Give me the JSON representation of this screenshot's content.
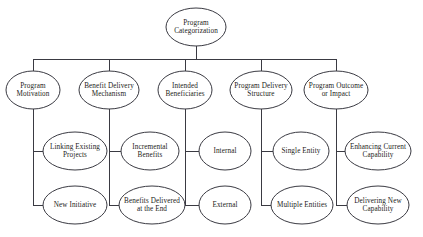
{
  "diagram": {
    "title": "Program Categorization",
    "node_shape": "open-sided-ellipse",
    "line_color": "#3a3a42",
    "text_color": "#1c1c20",
    "background_color": "#ffffff",
    "root": {
      "id": "program-categorization",
      "label": "Program\nCategorization",
      "cx": 196,
      "cy": 27,
      "rx": 30,
      "ry": 19
    },
    "branches": [
      {
        "id": "program-motivation",
        "label": "Program\nMotivation",
        "cx": 33,
        "cy": 90,
        "rx": 27,
        "ry": 19,
        "children": [
          {
            "id": "linking-existing-projects",
            "label": "Linking Existing\nProjects",
            "cx": 75,
            "cy": 151,
            "rx": 32,
            "ry": 19
          },
          {
            "id": "new-initiative",
            "label": "New Initiative",
            "cx": 75,
            "cy": 205,
            "rx": 32,
            "ry": 19
          }
        ]
      },
      {
        "id": "benefit-delivery-mechanism",
        "label": "Benefit Delivery\nMechanism",
        "cx": 109,
        "cy": 90,
        "rx": 30,
        "ry": 19,
        "children": [
          {
            "id": "incremental-benefits",
            "label": "Incremental\nBenefits",
            "cx": 150,
            "cy": 151,
            "rx": 29,
            "ry": 19
          },
          {
            "id": "benefits-delivered-at-the-end",
            "label": "Benefits Delivered\nat the End",
            "cx": 152,
            "cy": 205,
            "rx": 33,
            "ry": 19
          }
        ]
      },
      {
        "id": "intended-beneficiaries",
        "label": "Intended\nBeneficiaries",
        "cx": 185,
        "cy": 90,
        "rx": 27,
        "ry": 19,
        "children": [
          {
            "id": "internal",
            "label": "Internal",
            "cx": 225,
            "cy": 151,
            "rx": 26,
            "ry": 19
          },
          {
            "id": "external",
            "label": "External",
            "cx": 225,
            "cy": 205,
            "rx": 26,
            "ry": 19
          }
        ]
      },
      {
        "id": "program-delivery-structure",
        "label": "Program Delivery\nStructure",
        "cx": 261,
        "cy": 90,
        "rx": 31,
        "ry": 19,
        "children": [
          {
            "id": "single-entity",
            "label": "Single Entity",
            "cx": 301,
            "cy": 151,
            "rx": 28,
            "ry": 19
          },
          {
            "id": "multiple-entities",
            "label": "Multiple Entities",
            "cx": 302,
            "cy": 205,
            "rx": 31,
            "ry": 19
          }
        ]
      },
      {
        "id": "program-outcome-or-impact",
        "label": "Program Outcome\nor Impact",
        "cx": 336,
        "cy": 90,
        "rx": 32,
        "ry": 19,
        "children": [
          {
            "id": "enhancing-current-capability",
            "label": "Enhancing Current\nCapability",
            "cx": 378,
            "cy": 151,
            "rx": 33,
            "ry": 19
          },
          {
            "id": "delivering-new-capability",
            "label": "Delivering New\nCapability",
            "cx": 378,
            "cy": 205,
            "rx": 31,
            "ry": 19
          }
        ]
      }
    ]
  }
}
